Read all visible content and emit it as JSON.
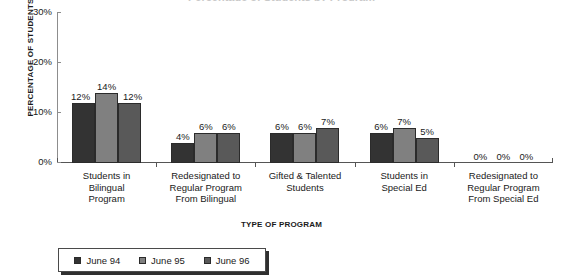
{
  "chart_data": {
    "type": "bar",
    "title": "Percentage of Students by Program",
    "xlabel": "TYPE OF PROGRAM",
    "ylabel": "PERCENTAGE OF STUDENTS",
    "ylim": [
      0,
      30
    ],
    "ytick_labels": [
      "0%",
      "10%",
      "20%",
      "30%"
    ],
    "ytick_values": [
      0,
      10,
      20,
      30
    ],
    "grid": false,
    "legend_position": "bottom-left",
    "categories": [
      "Students in\nBilingual\nProgram",
      "Redesignated to\nRegular Program\nFrom Bilingual",
      "Gifted & Talented\nStudents",
      "Students in\nSpecial Ed",
      "Redesignated to\nRegular Program\nFrom Special Ed"
    ],
    "category_lines": [
      [
        "Students in",
        "Bilingual",
        "Program"
      ],
      [
        "Redesignated to",
        "Regular Program",
        "From Bilingual"
      ],
      [
        "Gifted & Talented",
        "Students"
      ],
      [
        "Students in",
        "Special Ed"
      ],
      [
        "Redesignated to",
        "Regular Program",
        "From Special Ed"
      ]
    ],
    "series": [
      {
        "name": "June 94",
        "color": "#333333",
        "values": [
          12,
          4,
          6,
          6,
          0
        ],
        "labels": [
          "12%",
          "4%",
          "6%",
          "6%",
          "0%"
        ]
      },
      {
        "name": "June 95",
        "color": "#808080",
        "values": [
          14,
          6,
          6,
          7,
          0
        ],
        "labels": [
          "14%",
          "6%",
          "6%",
          "7%",
          "0%"
        ]
      },
      {
        "name": "June 96",
        "color": "#595959",
        "values": [
          12,
          6,
          7,
          5,
          0
        ],
        "labels": [
          "12%",
          "6%",
          "7%",
          "5%",
          "0%"
        ]
      }
    ]
  },
  "legend": {
    "items": [
      {
        "label": "June 94",
        "color": "#333333"
      },
      {
        "label": "June 95",
        "color": "#808080"
      },
      {
        "label": "June 96",
        "color": "#595959"
      }
    ]
  }
}
